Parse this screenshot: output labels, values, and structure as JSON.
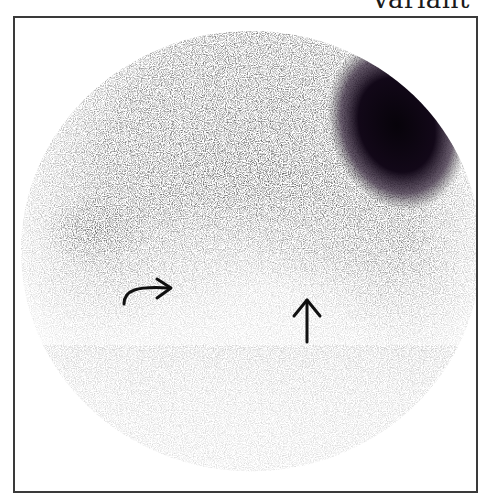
{
  "figure": {
    "label": "Variant",
    "modality": "scintigraphy image",
    "colors": {
      "frame": "#3a3a3a",
      "background": "#ffffff",
      "activity_dark": "#0e0710",
      "activity_mid": "#6a6a6a",
      "arrow": "#111111"
    },
    "annotations": [
      {
        "name": "curved-arrow",
        "direction": "right",
        "x": 122,
        "y": 285
      },
      {
        "name": "straight-arrow",
        "direction": "up",
        "x": 305,
        "y": 297
      }
    ]
  }
}
